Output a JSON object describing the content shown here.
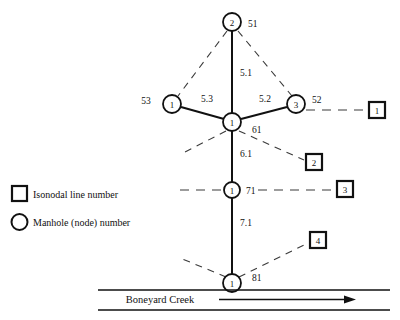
{
  "figure": {
    "background_color": "#ffffff",
    "line_color": "#111111",
    "dashed_color": "#3a3a3a"
  },
  "nodes": [
    {
      "id": "node-top",
      "label": "2",
      "iso_label": "51",
      "x": 232,
      "y": 22
    },
    {
      "id": "node-left",
      "label": "1",
      "iso_label": "53",
      "x": 172,
      "y": 104
    },
    {
      "id": "node-center",
      "label": "1",
      "iso_label": "61",
      "x": 232,
      "y": 122
    },
    {
      "id": "node-right",
      "label": "3",
      "iso_label": "52",
      "x": 296,
      "y": 104
    },
    {
      "id": "node-mid-lower",
      "label": "1",
      "iso_label": "71",
      "x": 232,
      "y": 190
    },
    {
      "id": "node-bottom",
      "label": "1",
      "iso_label": "81",
      "x": 232,
      "y": 283
    }
  ],
  "iso_boxes": [
    {
      "id": "iso-box-1",
      "label": "1",
      "x": 377,
      "y": 110
    },
    {
      "id": "iso-box-2",
      "label": "2",
      "x": 314,
      "y": 162
    },
    {
      "id": "iso-box-3",
      "label": "3",
      "x": 345,
      "y": 189
    },
    {
      "id": "iso-box-4",
      "label": "4",
      "x": 318,
      "y": 240
    }
  ],
  "edge_labels": [
    {
      "id": "edge-label-5-1",
      "text": "5.1",
      "x": 240,
      "y": 76
    },
    {
      "id": "edge-label-5-3",
      "text": "5.3",
      "x": 207,
      "y": 102
    },
    {
      "id": "edge-label-5-2",
      "text": "5.2",
      "x": 265,
      "y": 102
    },
    {
      "id": "edge-label-6-1",
      "text": "6.1",
      "x": 240,
      "y": 153
    },
    {
      "id": "edge-label-7-1",
      "text": "7.1",
      "x": 240,
      "y": 222
    }
  ],
  "creek": {
    "label": "Boneyard Creek",
    "flow_direction": "right"
  },
  "legend": {
    "items": [
      {
        "id": "legend-isonodal",
        "symbol": "square",
        "label": "Isonodal line number"
      },
      {
        "id": "legend-manhole",
        "symbol": "circle",
        "label": "Manhole (node) number"
      }
    ]
  }
}
